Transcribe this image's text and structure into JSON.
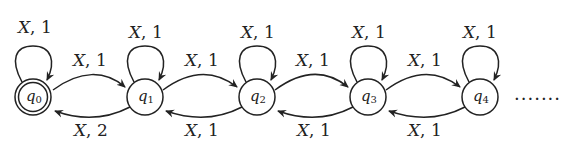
{
  "diagram": {
    "type": "state-machine",
    "states": [
      {
        "id": "q0",
        "name": "q",
        "sub": "0",
        "accepting": true
      },
      {
        "id": "q1",
        "name": "q",
        "sub": "1",
        "accepting": false
      },
      {
        "id": "q2",
        "name": "q",
        "sub": "2",
        "accepting": false
      },
      {
        "id": "q3",
        "name": "q",
        "sub": "3",
        "accepting": false
      },
      {
        "id": "q4",
        "name": "q",
        "sub": "4",
        "accepting": false
      }
    ],
    "self_loops": [
      {
        "state": "q0",
        "var": "X",
        "weight": "1"
      },
      {
        "state": "q1",
        "var": "X",
        "weight": "1"
      },
      {
        "state": "q2",
        "var": "X",
        "weight": "1"
      },
      {
        "state": "q3",
        "var": "X",
        "weight": "1"
      },
      {
        "state": "q4",
        "var": "X",
        "weight": "1"
      }
    ],
    "forward_edges": [
      {
        "from": "q0",
        "to": "q1",
        "var": "X",
        "weight": "1"
      },
      {
        "from": "q1",
        "to": "q2",
        "var": "X",
        "weight": "1"
      },
      {
        "from": "q2",
        "to": "q3",
        "var": "X",
        "weight": "1"
      },
      {
        "from": "q3",
        "to": "q4",
        "var": "X",
        "weight": "1"
      }
    ],
    "backward_edges": [
      {
        "from": "q1",
        "to": "q0",
        "var": "X",
        "weight": "2"
      },
      {
        "from": "q2",
        "to": "q1",
        "var": "X",
        "weight": "1"
      },
      {
        "from": "q3",
        "to": "q2",
        "var": "X",
        "weight": "1"
      },
      {
        "from": "q4",
        "to": "q3",
        "var": "X",
        "weight": "1"
      }
    ],
    "continuation": "......."
  }
}
